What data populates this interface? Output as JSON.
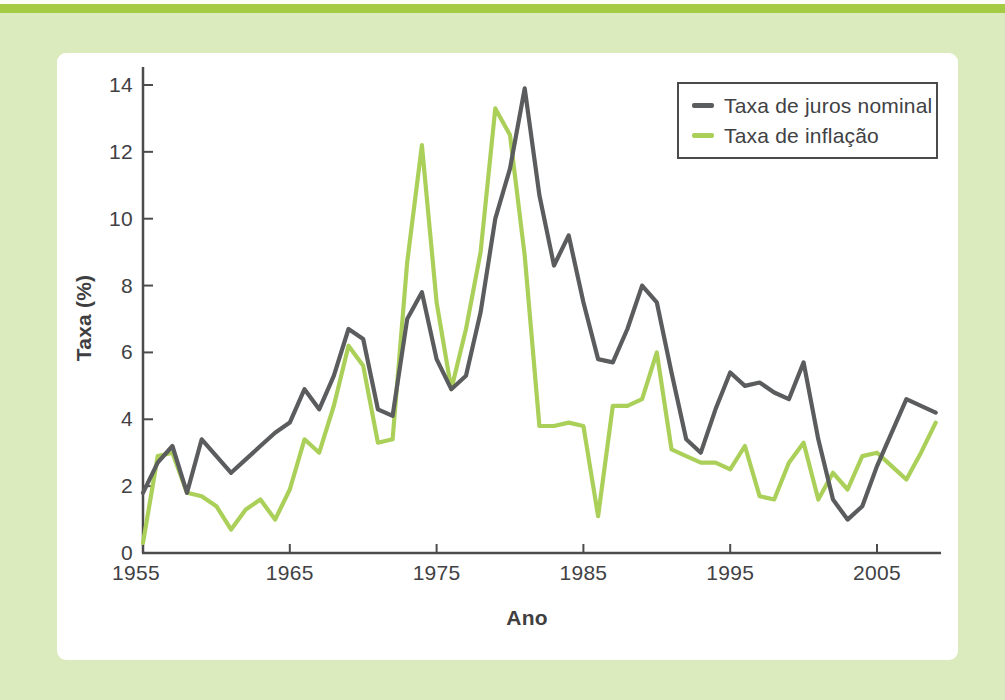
{
  "figure": {
    "background_color": "#dcebbe",
    "accent_bar_color": "#a5ca43",
    "panel_color": "#ffffff",
    "axis_color": "#4c4c4e",
    "text_color": "#414144"
  },
  "chart_data": {
    "type": "line",
    "title": "",
    "xlabel": "Ano",
    "ylabel": "Taxa (%)",
    "x_start": 1955,
    "x_end": 2009,
    "ylim": [
      0,
      14
    ],
    "y_ticks": [
      "0",
      "2",
      "4",
      "6",
      "8",
      "10",
      "12",
      "14"
    ],
    "y_tick_values": [
      0,
      2,
      4,
      6,
      8,
      10,
      12,
      14
    ],
    "x_ticks": [
      "1955",
      "1965",
      "1975",
      "1985",
      "1995",
      "2005"
    ],
    "x_tick_values": [
      1955,
      1965,
      1975,
      1985,
      1995,
      2005
    ],
    "grid": false,
    "legend_position": "top-right",
    "series": [
      {
        "name": "Taxa de juros nominal",
        "color": "#5b5c5e",
        "values": [
          1.8,
          2.7,
          3.2,
          1.8,
          3.4,
          2.9,
          2.4,
          2.8,
          3.2,
          3.6,
          3.9,
          4.9,
          4.3,
          5.3,
          6.7,
          6.4,
          4.3,
          4.1,
          7.0,
          7.8,
          5.8,
          4.9,
          5.3,
          7.2,
          10.0,
          11.5,
          13.9,
          10.7,
          8.6,
          9.5,
          7.5,
          5.8,
          5.7,
          6.7,
          8.0,
          7.5,
          5.4,
          3.4,
          3.0,
          4.3,
          5.4,
          5.0,
          5.1,
          4.8,
          4.6,
          5.7,
          3.4,
          1.6,
          1.0,
          1.4,
          2.6,
          3.6,
          4.6,
          4.4,
          4.2
        ]
      },
      {
        "name": "Taxa de inflação",
        "color": "#abd05a",
        "values": [
          0.3,
          2.9,
          3.0,
          1.8,
          1.7,
          1.4,
          0.7,
          1.3,
          1.6,
          1.0,
          1.9,
          3.4,
          3.0,
          4.4,
          6.2,
          5.6,
          3.3,
          3.4,
          8.7,
          12.2,
          7.5,
          4.9,
          6.7,
          9.0,
          13.3,
          12.5,
          8.9,
          3.8,
          3.8,
          3.9,
          3.8,
          1.1,
          4.4,
          4.4,
          4.6,
          6.0,
          3.1,
          2.9,
          2.7,
          2.7,
          2.5,
          3.2,
          1.7,
          1.6,
          2.7,
          3.3,
          1.6,
          2.4,
          1.9,
          2.9,
          3.0,
          2.6,
          2.2,
          3.0,
          3.9
        ]
      }
    ]
  }
}
